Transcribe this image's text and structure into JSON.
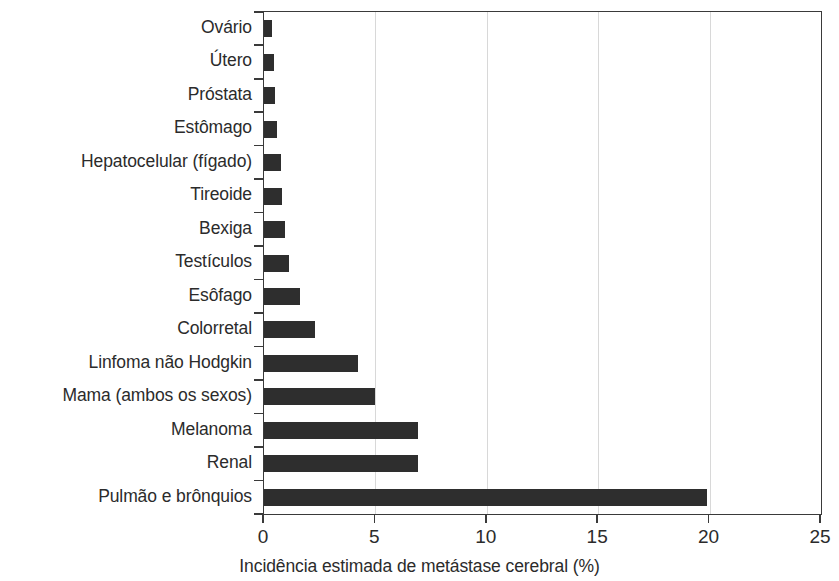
{
  "chart_data": {
    "type": "bar",
    "orientation": "horizontal",
    "title": "",
    "xlabel": "Incidência estimada de metástase cerebral (%)",
    "ylabel": "",
    "xlim": [
      0,
      25
    ],
    "xticks": [
      "0",
      "5",
      "10",
      "15",
      "20",
      "25"
    ],
    "xtick_values": [
      0,
      5,
      10,
      15,
      20,
      25
    ],
    "grid": "vertical-only",
    "legend": "none",
    "bar_color": "#2e2e2e",
    "axis_color": "#3a3a3a",
    "grid_color": "#d8d8d8",
    "categories": [
      "Ovário",
      "Útero",
      "Próstata",
      "Estômago",
      "Hepatocelular (fígado)",
      "Tireoide",
      "Bexiga",
      "Testículos",
      "Esôfago",
      "Colorretal",
      "Linfoma não Hodgkin",
      "Mama (ambos os sexos)",
      "Melanoma",
      "Renal",
      "Pulmão e brônquios"
    ],
    "values": [
      0.35,
      0.45,
      0.5,
      0.6,
      0.75,
      0.8,
      0.95,
      1.1,
      1.6,
      2.3,
      4.2,
      5.0,
      6.9,
      6.9,
      19.9
    ]
  }
}
